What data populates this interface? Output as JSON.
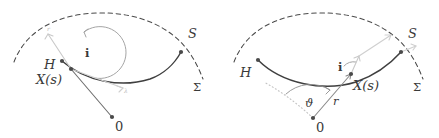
{
  "figure": {
    "type": "geometry-diagram",
    "background": "#ffffff",
    "curve_color": "#3f3f3f",
    "dashed_color": "#4a4a4a",
    "faint_color": "#c4c4c4",
    "label_color": "#3a3a3a",
    "panels": [
      {
        "id": "left",
        "labels": {
          "h": "H",
          "x_of_s": "X(s)",
          "s": "S",
          "sigma": "Σ",
          "origin": "0",
          "angle_i": "i",
          "faint_a": "r",
          "faint_b": "λ"
        }
      },
      {
        "id": "right",
        "labels": {
          "h": "H",
          "x_of_s": "X(s)",
          "s": "S",
          "sigma": "Σ",
          "origin": "0",
          "angle_i": "i",
          "angle_theta": "ϑ",
          "radius_r": "r"
        }
      }
    ]
  }
}
